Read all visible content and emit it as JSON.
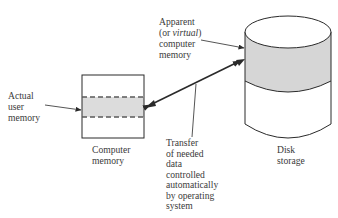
{
  "diagram": {
    "colors": {
      "line": "#2a2a2a",
      "shade": "#d9d9d9",
      "dash": "#5a5a5a",
      "text": "#3a3a3a"
    },
    "labels": {
      "actual_user_memory": [
        "Actual",
        "user",
        "memory"
      ],
      "apparent_memory": {
        "line1": "Apparent",
        "line2_prefix": "(or ",
        "line2_italic": "virtual",
        "line2_suffix": ")",
        "line3": "computer",
        "line4": "memory"
      },
      "computer_memory": [
        "Computer",
        "memory"
      ],
      "disk_storage": [
        "Disk",
        "storage"
      ],
      "transfer": [
        "Transfer",
        "of needed",
        "data",
        "controlled",
        "automatically",
        "by operating",
        "system"
      ]
    },
    "nodes": [
      {
        "id": "computer-memory",
        "shape": "rectangle",
        "shaded_band": "actual user memory"
      },
      {
        "id": "disk-storage",
        "shape": "cylinder",
        "shaded_band": "apparent (virtual) computer memory"
      }
    ],
    "edges": [
      {
        "from": "computer-memory",
        "to": "disk-storage",
        "type": "double-arrow",
        "label": "Transfer of needed data controlled automatically by operating system"
      }
    ]
  }
}
